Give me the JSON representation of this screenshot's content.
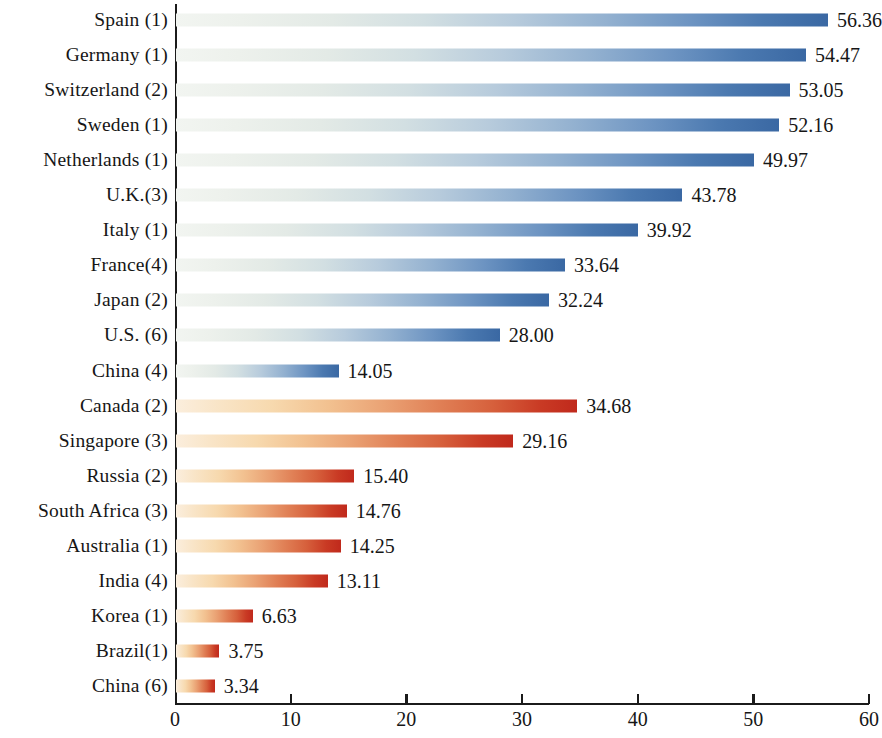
{
  "chart_data": {
    "type": "bar",
    "orientation": "horizontal",
    "title": "",
    "subtitle": "",
    "xlabel": "",
    "ylabel": "",
    "xlim": [
      0,
      60
    ],
    "ylim": null,
    "grid": false,
    "legend": null,
    "x_ticks": [
      0,
      10,
      20,
      30,
      40,
      50,
      60
    ],
    "x_tick_labels": [
      "0",
      "10",
      "20",
      "30",
      "40",
      "50",
      "60"
    ],
    "categories": [
      "Spain (1)",
      "Germany (1)",
      "Switzerland (2)",
      "Sweden (1)",
      "Netherlands (1)",
      "U.K.(3)",
      "Italy (1)",
      "France(4)",
      "Japan (2)",
      "U.S. (6)",
      "China (4)",
      "Canada (2)",
      "Singapore (3)",
      "Russia (2)",
      "South Africa (3)",
      "Australia (1)",
      "India (4)",
      "Korea (1)",
      "Brazil(1)",
      "China (6)"
    ],
    "values": [
      56.36,
      54.47,
      53.05,
      52.16,
      49.97,
      43.78,
      39.92,
      33.64,
      32.24,
      28.0,
      14.05,
      34.68,
      29.16,
      15.4,
      14.76,
      14.25,
      13.11,
      6.63,
      3.75,
      3.34
    ],
    "value_labels": [
      "56.36",
      "54.47",
      "53.05",
      "52.16",
      "49.97",
      "43.78",
      "39.92",
      "33.64",
      "32.24",
      "28.00",
      "14.05",
      "34.68",
      "29.16",
      "15.40",
      "14.76",
      "14.25",
      "13.11",
      "6.63",
      "3.75",
      "3.34"
    ],
    "groups": [
      "blue",
      "blue",
      "blue",
      "blue",
      "blue",
      "blue",
      "blue",
      "blue",
      "blue",
      "blue",
      "blue",
      "red",
      "red",
      "red",
      "red",
      "red",
      "red",
      "red",
      "red",
      "red"
    ],
    "colors": {
      "blue_start": "#f2f5f1",
      "blue_end": "#3a68a3",
      "red_start": "#fbeedd",
      "red_end": "#c0291c",
      "axis": "#1b1b1b",
      "text": "#161616",
      "background": "#ffffff"
    }
  }
}
